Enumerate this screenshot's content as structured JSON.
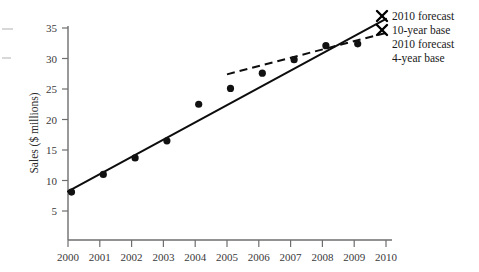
{
  "chart_data": {
    "type": "scatter",
    "title": "",
    "xlabel": "",
    "ylabel": "Sales ($ millions)",
    "x": [
      2000,
      2001,
      2002,
      2003,
      2004,
      2005,
      2006,
      2007,
      2008,
      2009
    ],
    "values": [
      8.1,
      11.0,
      13.7,
      16.5,
      22.5,
      25.1,
      27.6,
      29.8,
      32.1,
      32.4
    ],
    "xtick_labels": [
      "2000",
      "2001",
      "2002",
      "2003",
      "2004",
      "2005",
      "2006",
      "2007",
      "2008",
      "2009",
      "2010"
    ],
    "ytick_labels": [
      "5",
      "10",
      "15",
      "20",
      "25",
      "30",
      "35"
    ],
    "ytick_values": [
      5,
      10,
      15,
      20,
      25,
      30,
      35
    ],
    "xlim": [
      2000,
      2010
    ],
    "ylim": [
      0,
      36
    ],
    "grid": false,
    "legend_position": "right",
    "series": [
      {
        "name": "2010 forecast 10-year base",
        "type": "line",
        "style": "solid",
        "marker": "x-endpoint",
        "x": [
          2000,
          2010
        ],
        "values": [
          8.2,
          36.5
        ]
      },
      {
        "name": "2010 forecast 4-year base",
        "type": "line",
        "style": "dashed",
        "marker": "x-endpoint",
        "x": [
          2005,
          2010
        ],
        "values": [
          27.4,
          34.2
        ]
      }
    ],
    "legend": [
      {
        "label": "2010 forecast",
        "marker": "x-marker"
      },
      {
        "label": "10-year base",
        "marker": "x-marker"
      },
      {
        "label": "2010 forecast",
        "marker": "none"
      },
      {
        "label": "4-year base",
        "marker": "none"
      }
    ],
    "colors": {
      "data_point": "#111111",
      "trend_line": "#0d0d0d",
      "axis": "#6e6e6e",
      "text": "#1a1a1a",
      "background": "#ffffff"
    }
  }
}
